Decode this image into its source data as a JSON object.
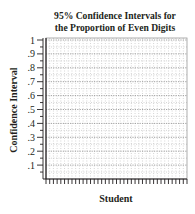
{
  "chart_data": {
    "type": "scatter",
    "title": "95% Confidence Intervals for the Proportion of Even Digits",
    "title_lines": [
      "95% Confidence Intervals for",
      "the Proportion of Even Digits"
    ],
    "xlabel": "Student",
    "ylabel": "Confidence Interval",
    "ylim": [
      0,
      1
    ],
    "yticks": [
      ".1",
      ".2",
      ".3",
      ".4",
      ".5",
      ".6",
      ".7",
      ".8",
      ".9",
      "1"
    ],
    "ytick_values": [
      0.1,
      0.2,
      0.3,
      0.4,
      0.5,
      0.6,
      0.7,
      0.8,
      0.9,
      1.0
    ],
    "x_minor_tick_count": 38,
    "y_minor_ticks_per_major": 2,
    "grid": "dotted",
    "series": [],
    "note": "Blank template grid; no data intervals plotted"
  },
  "colors": {
    "axis": "#231f20",
    "grid": "#b8b8b8",
    "background": "#ffffff"
  }
}
